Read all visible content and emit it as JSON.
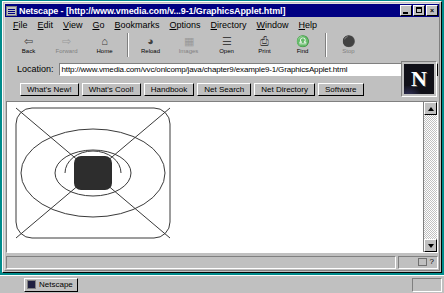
{
  "window": {
    "title": "Netscape - [http://www.vmedia.com/v...9-1/GraphicsApplet.html]",
    "icon": "netscape-document-icon",
    "controls": {
      "minimize": "_",
      "maximize": "",
      "close": "×"
    }
  },
  "menubar": {
    "items": [
      {
        "label": "File",
        "accel": "F"
      },
      {
        "label": "Edit",
        "accel": "E"
      },
      {
        "label": "View",
        "accel": "V"
      },
      {
        "label": "Go",
        "accel": "G"
      },
      {
        "label": "Bookmarks",
        "accel": "B"
      },
      {
        "label": "Options",
        "accel": "O"
      },
      {
        "label": "Directory",
        "accel": "D"
      },
      {
        "label": "Window",
        "accel": "W"
      },
      {
        "label": "Help",
        "accel": "H"
      }
    ]
  },
  "toolbar": {
    "buttons": [
      {
        "label": "Back",
        "icon": "back-arrow-icon",
        "glyph": "⇦",
        "disabled": false
      },
      {
        "label": "Forward",
        "icon": "forward-arrow-icon",
        "glyph": "⇨",
        "disabled": true
      },
      {
        "label": "Home",
        "icon": "home-icon",
        "glyph": "⌂",
        "disabled": false
      },
      {
        "label": "Reload",
        "icon": "reload-icon",
        "glyph": "◔",
        "disabled": false
      },
      {
        "label": "Images",
        "icon": "images-icon",
        "glyph": "▦",
        "disabled": true
      },
      {
        "label": "Open",
        "icon": "open-icon",
        "glyph": "☰",
        "disabled": false
      },
      {
        "label": "Print",
        "icon": "printer-icon",
        "glyph": "⎙",
        "disabled": false
      },
      {
        "label": "Find",
        "icon": "binoculars-icon",
        "glyph": "♎",
        "disabled": false
      },
      {
        "label": "Stop",
        "icon": "stop-icon",
        "glyph": "⛔",
        "disabled": true
      }
    ]
  },
  "location": {
    "label": "Location:",
    "url": "http://www.vmedia.com/vvc/onlcomp/java/chapter9/example9-1/GraphicsApplet.html",
    "dropdown_icon": "chevron-down-icon"
  },
  "directory_buttons": [
    {
      "label": "What's New!"
    },
    {
      "label": "What's Cool!"
    },
    {
      "label": "Handbook"
    },
    {
      "label": "Net Search"
    },
    {
      "label": "Net Directory"
    },
    {
      "label": "Software"
    }
  ],
  "logo": {
    "letter": "N",
    "name": "netscape-logo"
  },
  "applet": {
    "name": "GraphicsApplet",
    "shapes": [
      {
        "type": "round-rect-outline",
        "x": 4,
        "y": 4,
        "width": 154,
        "height": 130,
        "rx": 16,
        "stroke": "#3a3a3a"
      },
      {
        "type": "line",
        "x1": 4,
        "y1": 4,
        "x2": 158,
        "y2": 134,
        "stroke": "#3a3a3a"
      },
      {
        "type": "line",
        "x1": 158,
        "y1": 4,
        "x2": 4,
        "y2": 134,
        "stroke": "#3a3a3a"
      },
      {
        "type": "oval-outline",
        "cx": 81,
        "cy": 69,
        "rx": 72,
        "ry": 44,
        "stroke": "#3a3a3a"
      },
      {
        "type": "oval-outline",
        "cx": 81,
        "cy": 69,
        "rx": 38,
        "ry": 23,
        "stroke": "#3a3a3a"
      },
      {
        "type": "arc",
        "cx": 81,
        "cy": 69,
        "rx": 28,
        "ry": 22,
        "start_deg": 180,
        "end_deg": 360,
        "stroke": "#3a3a3a"
      },
      {
        "type": "round-rect-filled",
        "x": 62,
        "y": 52,
        "width": 38,
        "height": 34,
        "rx": 7,
        "fill": "#2d2d2d"
      }
    ]
  },
  "scrollbar": {
    "up_icon": "triangle-up-icon",
    "down_icon": "triangle-down-icon",
    "orientation": "vertical"
  },
  "statusbar": {
    "message": "",
    "security_icon": "broken-key-icon",
    "help_icon": "question-mark-icon",
    "help_glyph": "?"
  },
  "taskbar": {
    "task_label": "Netscape",
    "task_icon": "netscape-icon"
  },
  "colors": {
    "titlebar": "#000082",
    "face": "#c0c0c0",
    "desktop": "#008b8b",
    "canvas": "#ffffff",
    "ink": "#3a3a3a",
    "fill": "#2d2d2d"
  }
}
